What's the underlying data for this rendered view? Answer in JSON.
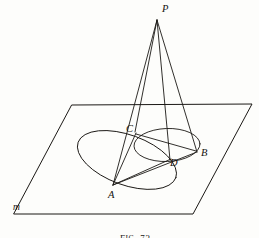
{
  "figure": {
    "caption_prefix": "F",
    "caption_smallcaps": "IG",
    "caption_suffix": ". 73",
    "caption_full": "Fig. 73",
    "stroke_color": "#1b1815",
    "background_color": "#fdfdfb"
  },
  "labels": {
    "apex": "P",
    "point_a": "A",
    "point_b": "B",
    "point_c": "C",
    "point_d": "D",
    "plane": "m"
  },
  "geometry": {
    "apex": {
      "x": 157,
      "y": 20
    },
    "points": {
      "A": {
        "x": 113,
        "y": 185
      },
      "B": {
        "x": 196,
        "y": 153
      },
      "C": {
        "x": 137,
        "y": 134
      },
      "D": {
        "x": 170,
        "y": 160
      }
    },
    "plane_polygon": [
      {
        "x": 72,
        "y": 105
      },
      {
        "x": 252,
        "y": 104
      },
      {
        "x": 193,
        "y": 214
      },
      {
        "x": 14,
        "y": 214
      }
    ],
    "base_ellipse": {
      "cx": 167,
      "cy": 145,
      "rx": 33,
      "ry": 16.5,
      "rotation": -2
    },
    "oblique_ellipse": {
      "cx": 127,
      "cy": 160,
      "rx": 52,
      "ry": 25,
      "rotation": 20
    },
    "cone_edges": [
      "P-A",
      "P-C",
      "P-D",
      "P-B"
    ],
    "chords": [
      "A-C",
      "A-D",
      "A-B",
      "C-B",
      "C-D"
    ]
  }
}
